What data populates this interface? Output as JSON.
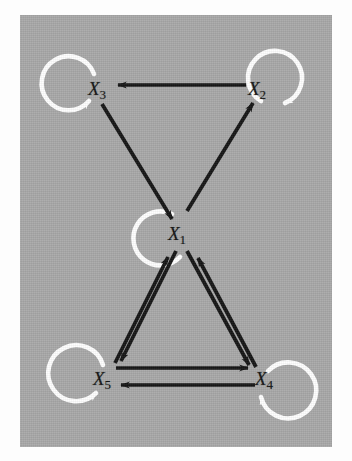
{
  "figure": {
    "panel": {
      "background_color": "#a8a8a8",
      "margin_color": "#fdfdfd",
      "x": 20,
      "y": 15,
      "width": 312,
      "height": 432
    },
    "edge_color": "#141414",
    "selfloop_color": "#ffffff",
    "label_color": "#141414"
  },
  "nodes": [
    {
      "id": "X1",
      "base": "X",
      "sub": "1",
      "x": 175,
      "y": 232,
      "selfloop": "right",
      "selfloop_label": "X1 self-loop"
    },
    {
      "id": "X2",
      "base": "X",
      "sub": "2",
      "x": 255,
      "y": 88,
      "selfloop": "upper-right",
      "selfloop_label": "X2 self-loop"
    },
    {
      "id": "X3",
      "base": "X",
      "sub": "3",
      "x": 95,
      "y": 88,
      "selfloop": "upper-left",
      "selfloop_label": "X3 self-loop"
    },
    {
      "id": "X4",
      "base": "X",
      "sub": "4",
      "x": 262,
      "y": 378,
      "selfloop": "lower-right",
      "selfloop_label": "X4 self-loop"
    },
    {
      "id": "X5",
      "base": "X",
      "sub": "5",
      "x": 100,
      "y": 378,
      "selfloop": "lower-left",
      "selfloop_label": "X5 self-loop"
    }
  ],
  "edges": [
    {
      "from": "X2",
      "to": "X3",
      "label": "X2 to X3",
      "style": "single"
    },
    {
      "from": "X3",
      "to": "X1",
      "label": "X3 to X1",
      "style": "single"
    },
    {
      "from": "X1",
      "to": "X2",
      "label": "X1 to X2",
      "style": "single"
    },
    {
      "from": "X1",
      "to": "X5",
      "label": "X1 to X5",
      "style": "parallel"
    },
    {
      "from": "X5",
      "to": "X1",
      "label": "X5 to X1",
      "style": "parallel"
    },
    {
      "from": "X1",
      "to": "X4",
      "label": "X1 to X4",
      "style": "parallel"
    },
    {
      "from": "X4",
      "to": "X1",
      "label": "X4 to X1",
      "style": "parallel"
    },
    {
      "from": "X5",
      "to": "X4",
      "label": "X5 to X4",
      "style": "parallel"
    },
    {
      "from": "X4",
      "to": "X5",
      "label": "X4 to X5",
      "style": "parallel"
    }
  ],
  "self_loops": [
    {
      "node": "X1",
      "label": "X1 to X1"
    },
    {
      "node": "X2",
      "label": "X2 to X2"
    },
    {
      "node": "X3",
      "label": "X3 to X3"
    },
    {
      "node": "X4",
      "label": "X4 to X4"
    },
    {
      "node": "X5",
      "label": "X5 to X5"
    }
  ]
}
